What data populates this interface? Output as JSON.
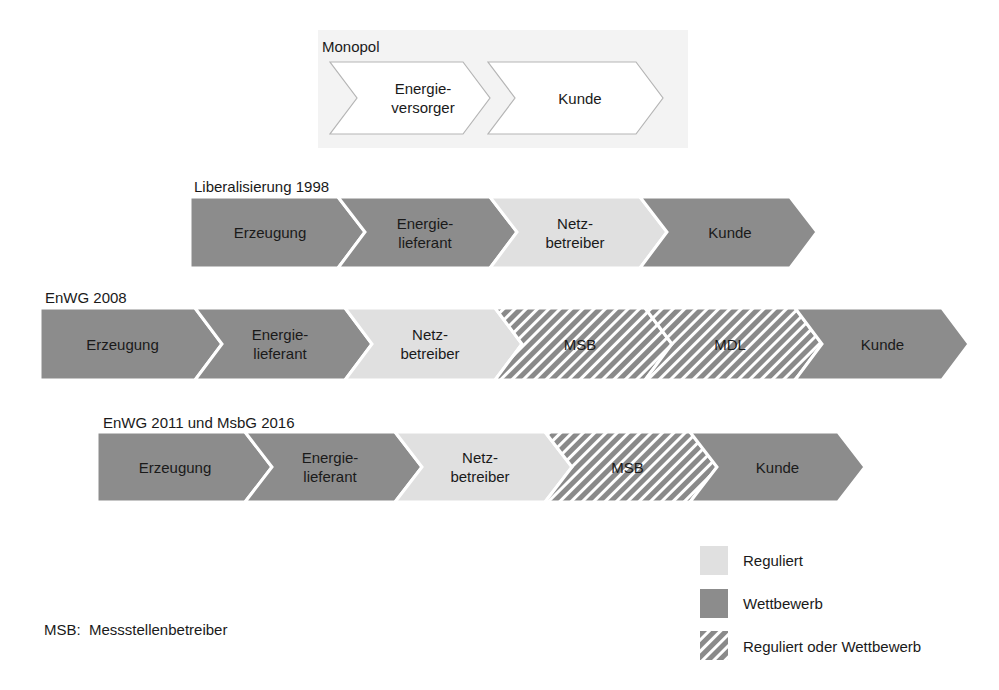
{
  "colors": {
    "wettbewerb": "#8c8c8c",
    "reguliert": "#e0e0e0",
    "monopol_fill": "#ffffff",
    "monopol_bg": "#f3f3f3",
    "hatch_stripe": "#8a8a8a",
    "outline": "#ffffff"
  },
  "groups": [
    {
      "title": "Monopol",
      "chevrons": [
        {
          "label": "Energie-\nversorger",
          "type": "monopol"
        },
        {
          "label": "Kunde",
          "type": "monopol"
        }
      ]
    },
    {
      "title": "Liberalisierung 1998",
      "chevrons": [
        {
          "label": "Erzeugung",
          "type": "wettbewerb"
        },
        {
          "label": "Energie-\nlieferant",
          "type": "wettbewerb"
        },
        {
          "label": "Netz-\nbetreiber",
          "type": "reguliert"
        },
        {
          "label": "Kunde",
          "type": "wettbewerb"
        }
      ]
    },
    {
      "title": "EnWG 2008",
      "chevrons": [
        {
          "label": "Erzeugung",
          "type": "wettbewerb"
        },
        {
          "label": "Energie-\nlieferant",
          "type": "wettbewerb"
        },
        {
          "label": "Netz-\nbetreiber",
          "type": "reguliert"
        },
        {
          "label": "MSB",
          "type": "hatched"
        },
        {
          "label": "MDL",
          "type": "hatched"
        },
        {
          "label": "Kunde",
          "type": "wettbewerb"
        }
      ]
    },
    {
      "title": "EnWG 2011 und MsbG 2016",
      "chevrons": [
        {
          "label": "Erzeugung",
          "type": "wettbewerb"
        },
        {
          "label": "Energie-\nlieferant",
          "type": "wettbewerb"
        },
        {
          "label": "Netz-\nbetreiber",
          "type": "reguliert"
        },
        {
          "label": "MSB",
          "type": "hatched"
        },
        {
          "label": "Kunde",
          "type": "wettbewerb"
        }
      ]
    }
  ],
  "legend": [
    {
      "label": "Reguliert",
      "type": "reguliert"
    },
    {
      "label": "Wettbewerb",
      "type": "wettbewerb"
    },
    {
      "label": "Reguliert oder Wettbewerb",
      "type": "hatched"
    }
  ],
  "footnote": "MSB:  Messstellenbetreiber"
}
